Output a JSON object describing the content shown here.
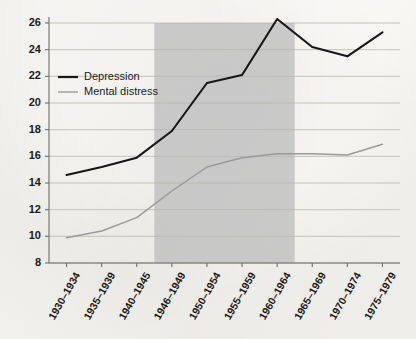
{
  "chart_data": {
    "type": "line",
    "title": "",
    "xlabel": "",
    "ylabel": "",
    "ylim": [
      8,
      26
    ],
    "yticks": [
      8,
      10,
      12,
      14,
      16,
      18,
      20,
      22,
      24,
      26
    ],
    "grid": true,
    "legend_position": "top-left",
    "categories": [
      "1930–1934",
      "1935–1939",
      "1940–1945",
      "1946–1949",
      "1950–1954",
      "1955–1959",
      "1960–1964",
      "1965–1969",
      "1970–1974",
      "1975–1979"
    ],
    "series": [
      {
        "name": "Depression",
        "color": "#161616",
        "values": [
          14.6,
          15.2,
          15.9,
          17.9,
          21.5,
          22.1,
          26.3,
          24.2,
          23.5,
          25.3
        ]
      },
      {
        "name": "Mental distress",
        "color": "#9a9a9a",
        "values": [
          9.9,
          10.4,
          11.4,
          13.4,
          15.2,
          15.9,
          16.2,
          16.2,
          16.1,
          16.9
        ]
      }
    ],
    "shaded_band": {
      "from_category": "1946–1949",
      "to_category": "1960–1964",
      "color": "#bfbfbf"
    },
    "annotations": []
  },
  "legend": {
    "items": [
      {
        "label": "Depression",
        "color": "#161616"
      },
      {
        "label": "Mental distress",
        "color": "#9a9a9a"
      }
    ]
  },
  "colors": {
    "paper": "#f4f2ee",
    "gridline": "#b9b6b0",
    "axis": "#6f6d69",
    "band": "#bfbfbf",
    "depression": "#161616",
    "distress": "#9a9a9a",
    "text": "#1a1a1a"
  }
}
